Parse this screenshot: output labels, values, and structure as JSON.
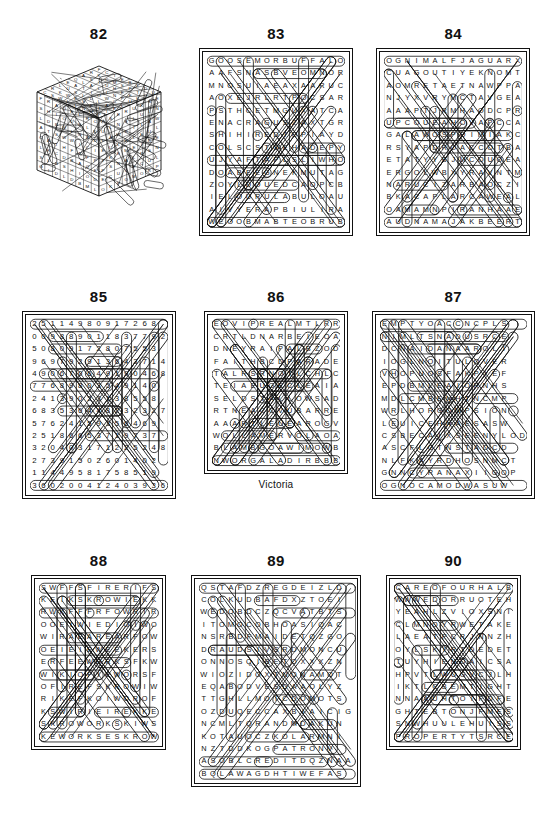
{
  "page": {
    "background": "#ffffff",
    "ink": "#111111",
    "layout": "3x3 grid of word-search puzzle solutions"
  },
  "puzzles": [
    {
      "number": "82",
      "kind": "cube",
      "caption": "",
      "rows": [
        "FEDCBUIL",
        "ROSKDPCOTM",
        "AKHSLEIRFU",
        "QUILDNAEPL",
        "ELOABWTKCI",
        "LEDUMLSHAL",
        "RISKLEWMTE",
        "CPLSGNWAHL"
      ]
    },
    {
      "number": "83",
      "kind": "letters",
      "caption": "",
      "rows": [
        "GOOSEMORBUFFALO",
        "AAFSNASBVEOMNOR",
        "MNOSUIAEAXAARUC",
        "AOXEJRLRTPOCSAR",
        "PSTHCETMGUXATCA",
        "ENACRAGUSZAXTGR",
        "SHIHIREDTOPIAYD",
        "COLSCSTOEHADEPY",
        "UJYAFTAPLSLIWHO",
        "DOABEEGNEKMUTAG",
        "ZOYLDOUEDCAOPCB",
        "IELOURULABULOAU",
        "AIVYERAPBIULIRA",
        "WEOOBMABTEOBRUB"
      ]
    },
    {
      "number": "84",
      "kind": "letters",
      "caption": "",
      "rows": [
        "OGNIMALFJAGUARX",
        "CUAGOUTIYEKNOMT",
        "AOMRETAETNAWPPA",
        "NJYXVRYMCTAVGEA",
        "AAAPTJRMHAODCPR",
        "UPCOUEAHOVAPCCA",
        "GALAWOSPOIMIAKC",
        "RSYAPDROACCOTBA",
        "ETATYYBJMCOUOEA",
        "ERGOLWBXYRAVNTM",
        "NARUCIZARBAOCZI",
        "BKACAPLARCAWEAL",
        "OAMAMNPIRANHAAE",
        "AUDNAMAJAKBEERT"
      ]
    },
    {
      "number": "85",
      "kind": "numbers",
      "caption": "",
      "rows": [
        "25114980917268",
        "00988901183779 2",
        "50809172807553",
        "96979291364371 4",
        "49067064919046 8",
        "77689803549140",
        "24139023138558",
        "68353644823232 7",
        "57624159356469",
        "25186653719737",
        "32040317122524 8",
        "27391502601402",
        "11449581758519",
        "36020041240393 6"
      ]
    },
    {
      "number": "86",
      "kind": "letters",
      "caption": "Victoria",
      "rows": [
        "EOVIPREALMTLRR",
        "CRTLDNARBEIEOA",
        "DNEYRAIPALBZOD",
        "FAITHBCDPARADE",
        "TALRSRNOTLCHLC",
        "TEIAEUGECLEAIA",
        "SELDSTALLOWSAD",
        "RTNEACCVUBARRE",
        "AAARTLEUEAROGV",
        "WOLLAMERVOLAOA",
        "BLAMBGOAWIMOWB",
        "NWORGALADIRBBB"
      ]
    },
    {
      "number": "87",
      "kind": "letters",
      "caption": "",
      "rows": [
        "EMPTYOACCNCPLS",
        "NIMLTSNADUSRCE",
        "DCNAIDANAAROLI",
        "IOGLNOITULOVER",
        "VHOPUOSFAKPIEF",
        "EPDBMLEAIORNHS",
        "MDLCMBENHTNCMP",
        "WRLHORGOMPSION",
        "LEUICEHNAESASW",
        "CSBECAIXSEENYLOD",
        "ASCFLGTNSTADCD",
        "NLFKAYRDHOSNMCT",
        "GNNCYRANAXIIGOP",
        "OGNOCAMODWASUW"
      ]
    },
    {
      "number": "88",
      "kind": "letters",
      "caption": "",
      "rows": [
        "SWFFSFIRERIFS",
        "KEIKSKROWIEKK",
        "RWKFFFRFOWRIR",
        "OOEIWIEDIOIWO",
        "WIRAEAREARFOW",
        "OEIEIEWEEKERS",
        "ERFEEWORKSFKW",
        "WIKIOFIEWORSF",
        "OFIREFSKROWIW",
        "RIKEFKOIWOROF",
        "KSWIRIEIREKKE",
        "SKROWORKSKIWS",
        "KEWORKSESKROW"
      ]
    },
    {
      "number": "89",
      "kind": "letters",
      "caption": "",
      "rows": [
        "QSTAFDZREGDEIZLD",
        "COLKUDBAFDXZTOEI",
        "WEDOBDCZQCVATBTS",
        "ITOMOCOBHOASIQAC",
        "NSRBDFMAIDETQZGO",
        "DRAUDSIVSRDMONCU",
        "ONNOSQIBETOXXXZN",
        "WIOZIDOXTNONAMOT",
        "EQABODVESDAAOLYZ",
        "TTGHLLMOICDOMOTS",
        "OZDUQECCAXBIAICIG",
        "NCMLTQRANDMDAKUN",
        "KOTAUOCZKOLARMNI",
        "NZTDDKOGPATRONV",
        "ASOBLCREDITDQZNAA",
        "BQLAWAGDHTIWEFAS"
      ]
    },
    {
      "number": "90",
      "kind": "letters",
      "caption": "",
      "rows": [
        "CAREOFOURHALB",
        "WWWEDORRUOTEH",
        "YEAHLZVIOXSNI",
        "CLMNOYRWETAKE",
        "LAEATPCRJNNZH",
        "OYLSKIRTDEDET",
        "TUYHIENOAICSA",
        "HPVTLWUGVCJLH",
        "IKTLCBEMTIGHT",
        "NNAAUHTOIFDFE",
        "GHTEBTONJFMES",
        "SNWHUULEHUISS",
        "PROPERTYTSRCE"
      ]
    }
  ]
}
